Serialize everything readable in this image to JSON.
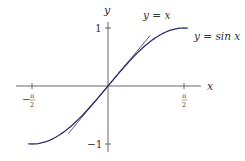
{
  "chart_data": {
    "type": "line",
    "title": "",
    "xlabel": "x",
    "ylabel": "y",
    "x_ticks": [
      {
        "value": -1.5708,
        "label_num": "π",
        "label_den": "2",
        "sign": "−"
      },
      {
        "value": 1.5708,
        "label_num": "π",
        "label_den": "2",
        "sign": ""
      }
    ],
    "y_ticks": [
      {
        "value": 1,
        "label": "1"
      },
      {
        "value": -1,
        "label": "−1"
      }
    ],
    "xlim": [
      -1.9,
      2.05
    ],
    "ylim": [
      -1.15,
      1.3
    ],
    "grid": false,
    "series": [
      {
        "name": "y = sin x",
        "label": "y = sin x",
        "color": "#2b2f6b",
        "function": "sin",
        "x_range": [
          -1.65,
          1.65
        ]
      },
      {
        "name": "y = x",
        "label": "y = x",
        "color": "#2b2f6b",
        "function": "identity",
        "x_range": [
          -0.82,
          0.87
        ]
      }
    ],
    "annotations": [
      {
        "text": "y = x",
        "near": "top end of tangent line"
      },
      {
        "text": "y = sin x",
        "near": "right end of sine curve"
      }
    ]
  },
  "labels": {
    "x_axis": "x",
    "y_axis": "y",
    "y_tick_pos": "1",
    "y_tick_neg": "−1",
    "x_tick_neg_sign": "−",
    "x_tick_num": "π",
    "x_tick_den": "2",
    "line_label": "y = x",
    "sine_label": "y = sin x"
  },
  "colors": {
    "curve": "#2b2f6b",
    "axis": "#555555",
    "text": "#333333"
  }
}
